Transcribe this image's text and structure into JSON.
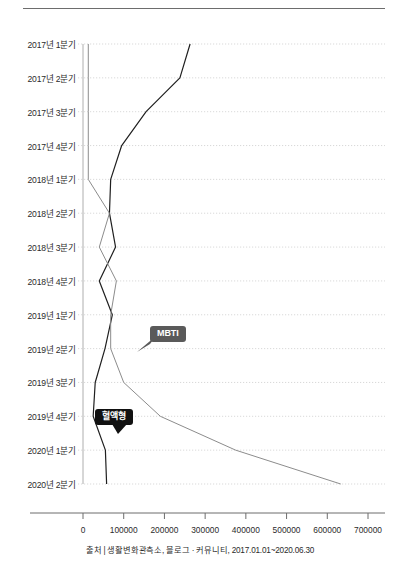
{
  "caption": "출처 | 생활변화관측소, 블로그 · 커뮤니티, 2017.01.01~2020.06.30",
  "callouts": {
    "mbti": "MBTI",
    "blood": "혈액형"
  },
  "colors": {
    "mbti_line": "#8c8c8c",
    "blood_line": "#1f1f1f",
    "mbti_badge": "#5a5a5a",
    "blood_badge": "#111111",
    "grid": "#cfcfcf",
    "axis": "#6d6d6d"
  },
  "chart_data": {
    "type": "line",
    "title": "",
    "xlabel": "",
    "ylabel": "",
    "orientation": "horizontal-categories-on-y",
    "grid": true,
    "legend": "annotations",
    "xlim": [
      0,
      700000
    ],
    "xticks": [
      0,
      100000,
      200000,
      300000,
      400000,
      500000,
      600000,
      700000
    ],
    "xtick_labels": [
      "0",
      "100000",
      "200000",
      "300000",
      "400000",
      "500000",
      "600000",
      "700000"
    ],
    "categories": [
      "2017년 1분기",
      "2017년 2분기",
      "2017년 3분기",
      "2017년 4분기",
      "2018년 1분기",
      "2018년 2분기",
      "2018년 3분기",
      "2018년 4분기",
      "2019년 1분기",
      "2019년 2분기",
      "2019년 3분기",
      "2019년 4분기",
      "2020년 1분기",
      "2020년 2분기"
    ],
    "series": [
      {
        "name": "혈액형",
        "color": "#1f1f1f",
        "values": [
          263000,
          238000,
          155000,
          95000,
          68000,
          65000,
          80000,
          40000,
          72000,
          54000,
          30000,
          25000,
          55000,
          58000
        ]
      },
      {
        "name": "MBTI",
        "color": "#8c8c8c",
        "values": [
          13000,
          13000,
          13000,
          13000,
          13000,
          65000,
          40000,
          82000,
          68000,
          68000,
          100000,
          190000,
          375000,
          633000
        ]
      }
    ]
  }
}
